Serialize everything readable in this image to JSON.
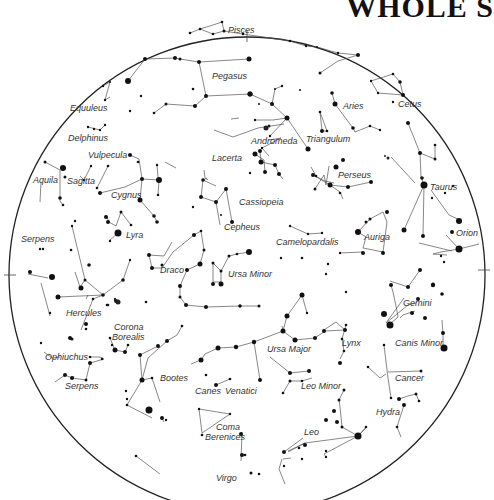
{
  "title": "WHOLE S",
  "chart": {
    "horizon": {
      "cx": 247,
      "cy": 275,
      "r": 238
    },
    "constellations": [
      {
        "name": "Pisces",
        "x": 228,
        "y": 33
      },
      {
        "name": "Pegasus",
        "x": 226,
        "y": 78
      },
      {
        "name": "Cetus",
        "x": 400,
        "y": 107
      },
      {
        "name": "Aries",
        "x": 343,
        "y": 106
      },
      {
        "name": "Equuleus",
        "x": 70,
        "y": 111
      },
      {
        "name": "Andromeda",
        "x": 253,
        "y": 143
      },
      {
        "name": "Triangulum",
        "x": 308,
        "y": 141
      },
      {
        "name": "Delphinus",
        "x": 68,
        "y": 141
      },
      {
        "name": "Vulpecula",
        "x": 88,
        "y": 157
      },
      {
        "name": "Lacerta",
        "x": 212,
        "y": 160
      },
      {
        "name": "Aquila",
        "x": 33,
        "y": 183
      },
      {
        "name": "Sagitta",
        "x": 67,
        "y": 184
      },
      {
        "name": "Cygnus",
        "x": 111,
        "y": 197
      },
      {
        "name": "Perseus",
        "x": 338,
        "y": 177
      },
      {
        "name": "Taurus",
        "x": 430,
        "y": 189
      },
      {
        "name": "Cassiopeia",
        "x": 239,
        "y": 204
      },
      {
        "name": "Lyra",
        "x": 126,
        "y": 238
      },
      {
        "name": "Cepheus",
        "x": 224,
        "y": 229
      },
      {
        "name": "Serpens",
        "x": 21,
        "y": 242
      },
      {
        "name": "Orion",
        "x": 456,
        "y": 236
      },
      {
        "name": "Auriga",
        "x": 372,
        "y": 240
      },
      {
        "name": "Camelopardalis",
        "x": 262,
        "y": 245
      },
      {
        "name": "Draco",
        "x": 160,
        "y": 273
      },
      {
        "name": "Ursa Minor",
        "x": 228,
        "y": 277
      },
      {
        "name": "Gemini",
        "x": 403,
        "y": 306
      },
      {
        "name": "Hercules",
        "x": 66,
        "y": 316
      },
      {
        "name": "Corona",
        "x": 88,
        "y": 330
      },
      {
        "name": "Borealis",
        "x": 87,
        "y": 340
      },
      {
        "name": "Canis Minor",
        "x": 392,
        "y": 346
      },
      {
        "name": "Lynx",
        "x": 370,
        "y": 345
      },
      {
        "name": "Ursa Major",
        "x": 267,
        "y": 352
      },
      {
        "name": "Ophiuchus",
        "x": 45,
        "y": 360
      },
      {
        "name": "Leo Minor",
        "x": 300,
        "y": 389
      },
      {
        "name": "Cancer",
        "x": 395,
        "y": 381
      },
      {
        "name": "Bootes",
        "x": 160,
        "y": 381
      },
      {
        "name": "Serpens",
        "x": 37,
        "y": 389
      },
      {
        "name": "Canes",
        "x": 195,
        "y": 394
      },
      {
        "name": "Venatici",
        "x": 231,
        "y": 394
      },
      {
        "name": "Hydra",
        "x": 376,
        "y": 415
      },
      {
        "name": "Coma",
        "x": 216,
        "y": 430
      },
      {
        "name": "Berenices",
        "x": 205,
        "y": 439
      },
      {
        "name": "Leo",
        "x": 304,
        "y": 435
      },
      {
        "name": "Virgo",
        "x": 217,
        "y": 480
      }
    ]
  }
}
